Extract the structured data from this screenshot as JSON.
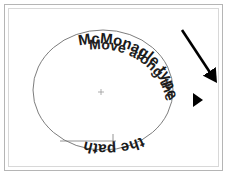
{
  "figure": {
    "background_color": "#ffffff",
    "frame": {
      "outer_border_color": "#b5b5b5",
      "inner_border_color": "#d8d8d8"
    }
  },
  "shapes": {
    "ellipse": {
      "name": "ellipse-path",
      "stroke_color": "#6e6e6e",
      "cx": 103,
      "cy": 90,
      "rx": 70,
      "ry": 60
    },
    "center_mark": {
      "name": "ellipse-center-mark",
      "x": 101,
      "y": 92,
      "color": "#9a9a9a"
    }
  },
  "labels": {
    "upper_text": "McMonagle type",
    "path_text": "Move along the path",
    "lower_text": "the path"
  },
  "annotations": {
    "arrow": {
      "name": "direction-arrow",
      "color": "#000000",
      "direction": "down-right",
      "x1": 182,
      "y1": 30,
      "x2": 214,
      "y2": 78
    },
    "cursor": {
      "name": "cursor-triangle",
      "color": "#000000",
      "x": 196,
      "y": 99
    }
  },
  "colors": {
    "text": "#1a1a1a",
    "stroke": "#6e6e6e",
    "accent": "#000000"
  }
}
